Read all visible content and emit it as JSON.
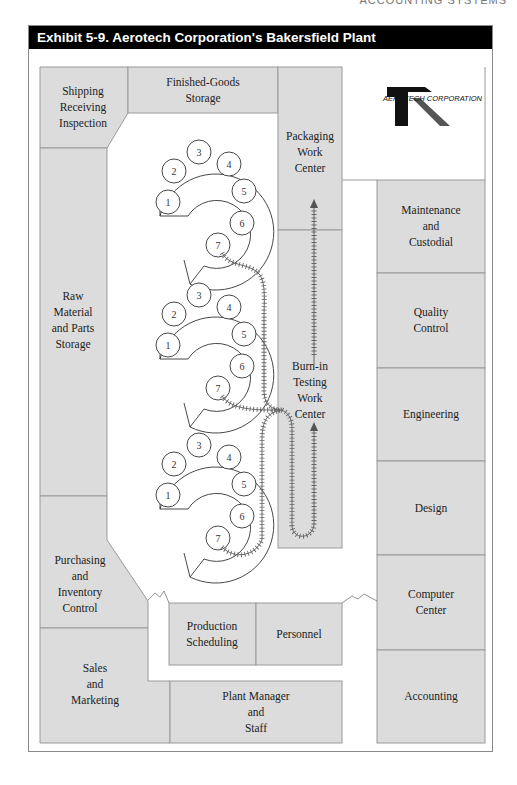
{
  "running_head": "ACCOUNTING SYSTEMS",
  "exhibit": {
    "title": "Exhibit 5-9. Aerotech Corporation's Bakersfield Plant"
  },
  "logo": {
    "letter": "R",
    "text": "AEROTECH CORPORATION"
  },
  "rooms": {
    "shipping": [
      "Shipping",
      "Receiving",
      "Inspection"
    ],
    "finished_goods": [
      "Finished-Goods",
      "Storage"
    ],
    "packaging": [
      "Packaging",
      "Work",
      "Center"
    ],
    "raw_material": [
      "Raw",
      "Material",
      "and Parts",
      "Storage"
    ],
    "burn_in": [
      "Burn-in",
      "Testing",
      "Work",
      "Center"
    ],
    "maintenance": [
      "Maintenance",
      "and",
      "Custodial"
    ],
    "quality": [
      "Quality",
      "Control"
    ],
    "engineering": [
      "Engineering"
    ],
    "design": [
      "Design"
    ],
    "computer": [
      "Computer",
      "Center"
    ],
    "accounting": [
      "Accounting"
    ],
    "purchasing": [
      "Purchasing",
      "and",
      "Inventory",
      "Control"
    ],
    "production": [
      "Production",
      "Scheduling"
    ],
    "personnel": [
      "Personnel"
    ],
    "sales": [
      "Sales",
      "and",
      "Marketing"
    ],
    "plant_manager": [
      "Plant Manager",
      "and",
      "Staff"
    ]
  },
  "assembly_lines": [
    {
      "name": "line-1",
      "stations": [
        "1",
        "2",
        "3",
        "4",
        "5",
        "6",
        "7"
      ]
    },
    {
      "name": "line-2",
      "stations": [
        "1",
        "2",
        "3",
        "4",
        "5",
        "6",
        "7"
      ]
    },
    {
      "name": "line-3",
      "stations": [
        "1",
        "2",
        "3",
        "4",
        "5",
        "6",
        "7"
      ]
    }
  ],
  "colors": {
    "room_fill": "#dcdcdc",
    "room_border": "#9a9a9a",
    "header_bg": "#000000",
    "header_text": "#ffffff"
  }
}
